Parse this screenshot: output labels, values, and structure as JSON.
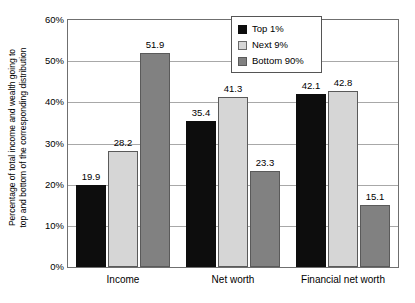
{
  "chart_data": {
    "type": "bar",
    "title": "",
    "xlabel": "",
    "ylabel": "Percentage of total income and wealth going to top and bottom of the corresponding distribution",
    "ylabel_line1": "Percentage of total income and wealth going to",
    "ylabel_line2": "top and bottom of the corresponding distribution",
    "categories": [
      "Income",
      "Net worth",
      "Financial net worth"
    ],
    "series": [
      {
        "name": "Top 1%",
        "values": [
          19.9,
          35.4,
          42.1
        ],
        "color": "#0d0d0d"
      },
      {
        "name": "Next 9%",
        "values": [
          28.2,
          41.3,
          42.8
        ],
        "color": "#d6d6d6"
      },
      {
        "name": "Bottom 90%",
        "values": [
          51.9,
          23.3,
          15.1
        ],
        "color": "#818181"
      }
    ],
    "ylim": [
      0,
      60
    ],
    "yticks": [
      0,
      10,
      20,
      30,
      40,
      50,
      60
    ],
    "ytick_labels": [
      "0%",
      "10%",
      "20%",
      "30%",
      "40%",
      "50%",
      "60%"
    ],
    "grid": true,
    "grid_axis": "y",
    "legend_position": "top-center-right",
    "data_labels": true
  },
  "legend": {
    "items": [
      {
        "label": "Top 1%"
      },
      {
        "label": "Next 9%"
      },
      {
        "label": "Bottom 90%"
      }
    ]
  }
}
